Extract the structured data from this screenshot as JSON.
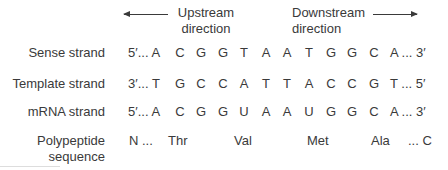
{
  "header": {
    "upstream": {
      "line1": "Upstream",
      "line2": "direction"
    },
    "downstream": {
      "line1": "Downstream",
      "line2": "direction"
    }
  },
  "rows": {
    "sense": {
      "label": "Sense strand",
      "start": "5′... A",
      "bases": [
        "C",
        "G",
        "G",
        "T",
        "A",
        "A",
        "T",
        "G",
        "G",
        "C"
      ],
      "end": "A ... 3′"
    },
    "template": {
      "label": "Template strand",
      "start": "3′... T",
      "bases": [
        "G",
        "C",
        "C",
        "A",
        "T",
        "T",
        "A",
        "C",
        "C",
        "G"
      ],
      "end": "T ... 5′"
    },
    "mrna": {
      "label": "mRNA strand",
      "start": "5′... A",
      "bases": [
        "C",
        "G",
        "G",
        "U",
        "A",
        "A",
        "U",
        "G",
        "G",
        "C"
      ],
      "end": "A ... 3′"
    },
    "polypeptide": {
      "label_line1": "Polypeptide",
      "label_line2": "sequence",
      "n_term": "N ...",
      "residues": [
        "Thr",
        "Val",
        "Met",
        "Ala"
      ],
      "c_term": "... C"
    }
  }
}
